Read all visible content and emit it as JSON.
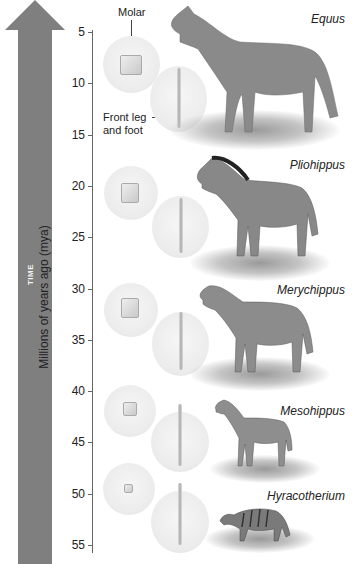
{
  "arrow": {
    "label": "TIME",
    "color": "#7f7f7f"
  },
  "axis": {
    "label": "Millions of years ago (mya)",
    "ticks": [
      "5",
      "10",
      "15",
      "20",
      "25",
      "30",
      "35",
      "40",
      "45",
      "50",
      "55"
    ]
  },
  "annotations": {
    "molar": "Molar",
    "front_leg_line1": "Front leg",
    "front_leg_line2": "and foot"
  },
  "species": [
    {
      "name": "Equus"
    },
    {
      "name": "Pliohippus"
    },
    {
      "name": "Merychippus"
    },
    {
      "name": "Mesohippus"
    },
    {
      "name": "Hyracotherium"
    }
  ]
}
